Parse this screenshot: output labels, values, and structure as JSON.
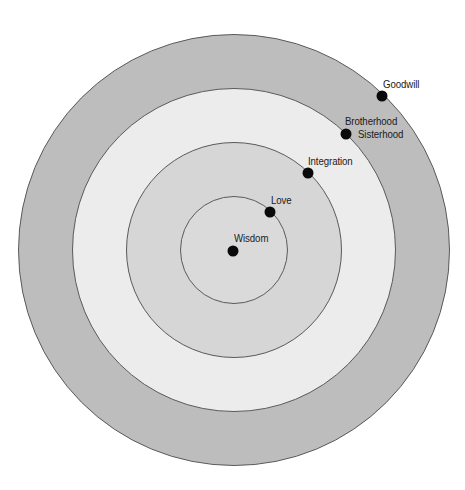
{
  "diagram": {
    "type": "concentric-circles",
    "center": {
      "x": 234,
      "y": 250
    },
    "rings": [
      {
        "name": "outer-ring",
        "radius": 216,
        "fill": "#bdbdbd"
      },
      {
        "name": "ring-2",
        "radius": 162,
        "fill": "#ececec"
      },
      {
        "name": "ring-3",
        "radius": 108,
        "fill": "#d6d6d6"
      },
      {
        "name": "inner-core",
        "radius": 54,
        "fill": "#dadada"
      }
    ],
    "stroke_color": "#5a5a5a",
    "dot_color": "#0a0a0a",
    "points": [
      {
        "id": "wisdom",
        "label": "Wisdom",
        "dot": {
          "x": 233,
          "y": 251
        },
        "label_pos": {
          "x": 234,
          "y": 232
        }
      },
      {
        "id": "love",
        "label": "Love",
        "dot": {
          "x": 270,
          "y": 212
        },
        "label_pos": {
          "x": 271,
          "y": 194
        }
      },
      {
        "id": "integration",
        "label": "Integration",
        "dot": {
          "x": 308,
          "y": 173
        },
        "label_pos": {
          "x": 308,
          "y": 155
        }
      },
      {
        "id": "brotherhood",
        "label": "Brotherhood",
        "dot": {
          "x": 346,
          "y": 134
        },
        "label_pos": {
          "x": 345,
          "y": 115
        }
      },
      {
        "id": "sisterhood",
        "label": "Sisterhood",
        "dot": null,
        "label_pos": {
          "x": 358,
          "y": 128
        }
      },
      {
        "id": "goodwill",
        "label": "Goodwill",
        "dot": {
          "x": 382,
          "y": 96
        },
        "label_pos": {
          "x": 383,
          "y": 78
        }
      }
    ]
  }
}
